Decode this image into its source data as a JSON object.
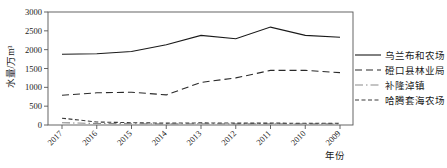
{
  "chart_data": {
    "type": "line",
    "xlabel": "年份",
    "ylabel": "水量/万m³",
    "categories": [
      "2017",
      "2016",
      "2015",
      "2014",
      "2013",
      "2012",
      "2011",
      "2010",
      "2009"
    ],
    "ylim": [
      0,
      3000
    ],
    "ytick_step": 500,
    "yticks": [
      0,
      500,
      1000,
      1500,
      2000,
      2500,
      3000
    ],
    "grid": false,
    "legend_position": "right-outside",
    "series": [
      {
        "name": "乌兰布和农场",
        "style": "solid",
        "color": "#1a1a1a",
        "values": [
          1880,
          1890,
          1950,
          2130,
          2380,
          2290,
          2600,
          2380,
          2330
        ]
      },
      {
        "name": "磴口县林业局",
        "style": "long-dash",
        "color": "#2a2a2a",
        "values": [
          790,
          855,
          870,
          800,
          1130,
          1250,
          1450,
          1450,
          1390
        ]
      },
      {
        "name": "补隆淖镇",
        "style": "dash-dot",
        "color": "#8a8a8a",
        "values": [
          60,
          40,
          35,
          30,
          35,
          30,
          35,
          30,
          30
        ]
      },
      {
        "name": "哈腾套海农场",
        "style": "short-dash",
        "color": "#3a3a3a",
        "values": [
          180,
          80,
          60,
          50,
          55,
          50,
          50,
          45,
          45
        ]
      }
    ],
    "colors": {
      "background": "#ffffff",
      "axis": "#555555",
      "tick_text": "#1a1a1a"
    }
  }
}
